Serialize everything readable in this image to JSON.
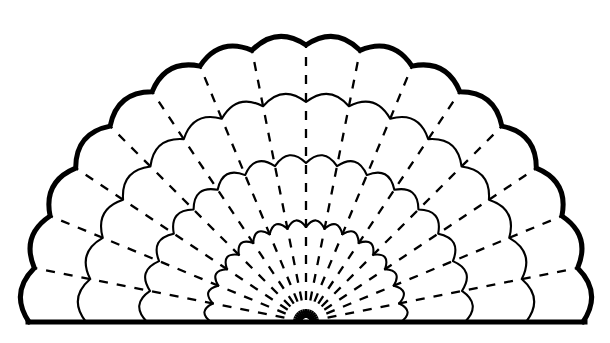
{
  "document": {
    "title": "Folding Fan Outline Diagram",
    "type": "line-art-diagram",
    "background_color": "#ffffff",
    "ink_color": "#000000"
  },
  "figure": {
    "name": "scalloped-folding-fan",
    "description": "Semicircular folding fan with scalloped outer edge, three nested scalloped inner rows and dashed radial fold lines converging at a pivot on the flat baseline.",
    "canvas": {
      "width": 610,
      "height": 343
    },
    "pivot": {
      "x": 306,
      "y": 322
    },
    "baseline": {
      "x1": 28,
      "x2": 585,
      "y": 322,
      "stroke_width": 5
    },
    "angles": {
      "start_deg": 180,
      "end_deg": 360,
      "span_deg": 180
    },
    "segments": 16,
    "rib_count": 17,
    "outer_edge": {
      "name": "outer-scalloped-edge",
      "radius": 290,
      "scallop_depth": 13,
      "stroke_width": 5,
      "stroke_color": "#000000",
      "scallop_count": 16
    },
    "inner_rows": [
      {
        "name": "inner-scallop-row-1",
        "radius": 232,
        "scallop_depth": 12,
        "stroke_width": 2.1,
        "stroke_color": "#000000"
      },
      {
        "name": "inner-scallop-row-2",
        "radius": 170,
        "scallop_depth": 11,
        "stroke_width": 2.1,
        "stroke_color": "#000000"
      },
      {
        "name": "inner-scallop-row-3",
        "radius": 104,
        "scallop_depth": 9,
        "stroke_width": 2.1,
        "stroke_color": "#000000"
      }
    ],
    "ribs": {
      "name": "dashed-radial-fold-lines",
      "stroke_width": 2.3,
      "stroke_color": "#000000",
      "dash_pattern": "9 9",
      "inner_radius": 4,
      "outer_radius": 290,
      "count": 17,
      "style": "dashed"
    }
  },
  "chart_data": {
    "type": "scatter",
    "xlabel": "",
    "ylabel": "",
    "categories": [],
    "values": []
  }
}
